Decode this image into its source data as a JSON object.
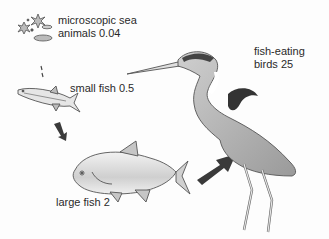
{
  "diagram": {
    "type": "food-chain",
    "stages": [
      {
        "id": "microscopic",
        "line1": "microscopic sea",
        "line2": "animals 0.04",
        "value": 0.04
      },
      {
        "id": "small-fish",
        "label": "small fish 0.5",
        "value": 0.5
      },
      {
        "id": "large-fish",
        "label": "large fish 2",
        "value": 2
      },
      {
        "id": "birds",
        "line1": "fish-eating",
        "line2": "birds 25",
        "value": 25
      }
    ],
    "colors": {
      "background": "#fdfdfd",
      "text": "#2a2a2a",
      "arrow": "#3a3a3a",
      "outline": "#5a5a5a",
      "fill_light": "#d8d8d8",
      "fill_mid": "#a8a8a8",
      "fill_dark": "#3c3c3c"
    }
  }
}
